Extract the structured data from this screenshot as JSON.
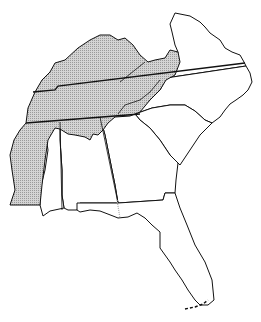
{
  "map": {
    "title": "",
    "region": "Southeastern United States",
    "shading": {
      "fill_color": "#c8c8c8",
      "pattern": "stippled",
      "description": "Shaded region covering Kentucky, Tennessee, western Virginia, northern Alabama, western Mississippi"
    },
    "states": [
      {
        "id": "kentucky",
        "shaded": true
      },
      {
        "id": "tennessee",
        "shaded": true
      },
      {
        "id": "virginia",
        "shaded": "partial"
      },
      {
        "id": "north-carolina",
        "shaded": "partial"
      },
      {
        "id": "south-carolina",
        "shaded": false
      },
      {
        "id": "georgia",
        "shaded": false
      },
      {
        "id": "alabama",
        "shaded": "partial"
      },
      {
        "id": "mississippi",
        "shaded": "partial"
      },
      {
        "id": "florida",
        "shaded": false
      }
    ],
    "stroke_color": "#111111",
    "background": "#ffffff"
  }
}
